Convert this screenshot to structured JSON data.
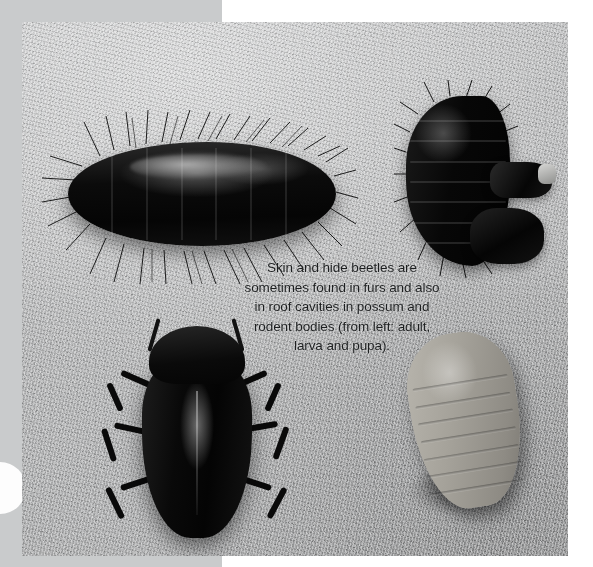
{
  "page": {
    "background_color": "#ffffff",
    "left_band_color": "#c9cbcc"
  },
  "photo": {
    "type": "photograph",
    "subject": "skin and hide beetles (dermestid) life stages",
    "background_color": "#b7b8b9",
    "specimens": [
      {
        "name": "larva-large",
        "label": "larva",
        "position": "top-left",
        "description": "large black hairy larva with bristles",
        "color": "#060606"
      },
      {
        "name": "larva-curled",
        "label": "larva",
        "position": "top-right",
        "description": "curled black hairy larva with shed fragments",
        "color": "#080808"
      },
      {
        "name": "beetle-adult",
        "label": "adult",
        "position": "bottom-left",
        "description": "dark oval adult beetle with legs and antennae",
        "color": "#0a0a0a"
      },
      {
        "name": "pupa",
        "label": "pupa",
        "position": "bottom-right",
        "description": "pale segmented oval pupa",
        "color": "#a5a29a"
      }
    ]
  },
  "caption": {
    "color": "#1d1f20",
    "lines": [
      "Skin and hide beetles are",
      "sometimes found in furs and also",
      "in roof cavities in possum and",
      "rodent bodies (from left: adult,",
      "larva and pupa)."
    ]
  }
}
